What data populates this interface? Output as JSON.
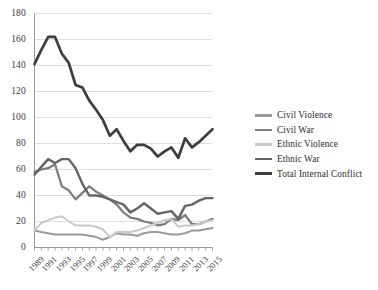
{
  "chart_data": {
    "type": "line",
    "title": "",
    "xlabel": "",
    "ylabel": "",
    "grid": "horizontal",
    "legend_position": "right",
    "xlim": [
      1989,
      2015
    ],
    "ylim": [
      0,
      180
    ],
    "ytick_step": 20,
    "yticks": [
      0,
      20,
      40,
      60,
      80,
      100,
      120,
      140,
      160,
      180
    ],
    "x": [
      1989,
      1990,
      1991,
      1992,
      1993,
      1994,
      1995,
      1996,
      1997,
      1998,
      1999,
      2000,
      2001,
      2002,
      2003,
      2004,
      2005,
      2006,
      2007,
      2008,
      2009,
      2010,
      2011,
      2012,
      2013,
      2014,
      2015
    ],
    "xtick_labels": [
      "1989",
      "1991",
      "1993",
      "1995",
      "1997",
      "1999",
      "2001",
      "2003",
      "2005",
      "2007",
      "2009",
      "2011",
      "2013",
      "2015"
    ],
    "series": [
      {
        "name": "Civil Violence",
        "color": "#9a9a9a",
        "width": 2.0,
        "values": [
          13,
          12,
          11,
          10,
          10,
          10,
          10,
          10,
          9,
          8,
          6,
          8,
          11,
          10,
          10,
          9,
          11,
          12,
          12,
          11,
          10,
          10,
          11,
          13,
          13,
          14,
          15
        ]
      },
      {
        "name": "Civil War",
        "color": "#7c7c7c",
        "width": 2.2,
        "values": [
          58,
          60,
          61,
          64,
          47,
          44,
          37,
          42,
          47,
          43,
          40,
          37,
          33,
          27,
          23,
          22,
          20,
          19,
          17,
          18,
          22,
          21,
          25,
          18,
          18,
          20,
          22
        ]
      },
      {
        "name": "Ethnic Violence",
        "color": "#c9c9c9",
        "width": 2.0,
        "values": [
          13,
          19,
          21,
          23,
          24,
          20,
          17,
          17,
          17,
          16,
          14,
          8,
          12,
          12,
          12,
          13,
          15,
          17,
          19,
          21,
          22,
          16,
          17,
          17,
          18,
          20,
          21
        ]
      },
      {
        "name": "Ethnic War",
        "color": "#656565",
        "width": 2.4,
        "values": [
          56,
          62,
          68,
          65,
          68,
          68,
          61,
          49,
          40,
          40,
          39,
          37,
          35,
          33,
          27,
          30,
          34,
          30,
          26,
          27,
          28,
          22,
          32,
          33,
          36,
          38,
          38
        ]
      },
      {
        "name": "Total Internal Conflict",
        "color": "#3d3d3d",
        "width": 2.7,
        "values": [
          141,
          152,
          162,
          162,
          149,
          142,
          125,
          123,
          113,
          106,
          98,
          86,
          91,
          82,
          74,
          79,
          79,
          76,
          70,
          74,
          77,
          69,
          84,
          77,
          81,
          86,
          91
        ]
      }
    ]
  },
  "axis": {
    "y_labels": [
      "180",
      "160",
      "140",
      "120",
      "100",
      "80",
      "60",
      "40",
      "20",
      "0"
    ],
    "x_labels": [
      "1989",
      "1991",
      "1993",
      "1995",
      "1997",
      "1999",
      "2001",
      "2003",
      "2005",
      "2007",
      "2009",
      "2011",
      "2013",
      "2015"
    ]
  },
  "legend": {
    "items": [
      {
        "label": "Civil Violence",
        "color": "#9a9a9a"
      },
      {
        "label": "Civil War",
        "color": "#7c7c7c"
      },
      {
        "label": "Ethnic Violence",
        "color": "#c9c9c9"
      },
      {
        "label": "Ethnic War",
        "color": "#656565"
      },
      {
        "label": "Total Internal Conflict",
        "color": "#3d3d3d"
      }
    ]
  }
}
